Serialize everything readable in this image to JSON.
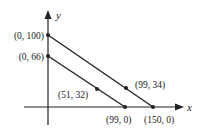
{
  "axes": {
    "x_label": "x",
    "y_label": "y"
  },
  "lines": [
    {
      "name": "upper-line",
      "points": [
        {
          "label": "(0, 100)",
          "x": 0,
          "y": 100
        },
        {
          "label": "(99, 34)",
          "x": 99,
          "y": 34
        },
        {
          "label": "(150, 0)",
          "x": 150,
          "y": 0
        }
      ]
    },
    {
      "name": "lower-line",
      "points": [
        {
          "label": "(0, 66)",
          "x": 0,
          "y": 66
        },
        {
          "label": "(51, 32)",
          "x": 51,
          "y": 32
        },
        {
          "label": "(99, 0)",
          "x": 99,
          "y": 0
        }
      ]
    }
  ],
  "colors": {
    "ink": "#222222",
    "background": "#ffffff"
  }
}
